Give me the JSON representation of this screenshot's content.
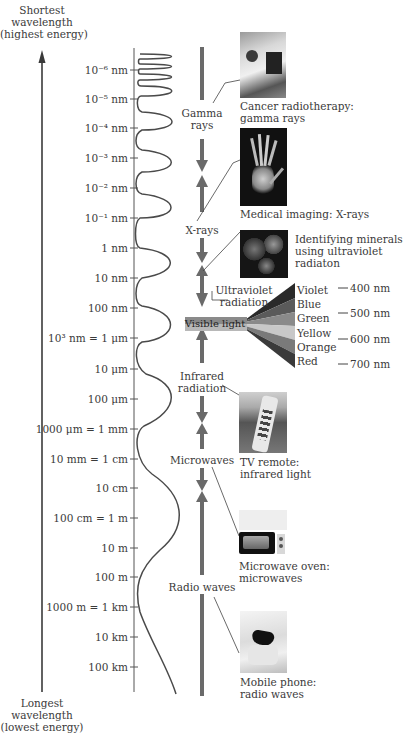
{
  "diagram": {
    "title_top": [
      "Shortest",
      "wavelength",
      "(highest energy)"
    ],
    "title_bottom": [
      "Longest",
      "wavelength",
      "(lowest energy)"
    ],
    "scale_ticks": [
      {
        "label": "10⁻⁶ nm",
        "y": 70
      },
      {
        "label": "10⁻⁵ nm",
        "y": 99
      },
      {
        "label": "10⁻⁴ nm",
        "y": 128
      },
      {
        "label": "10⁻³ nm",
        "y": 158
      },
      {
        "label": "10⁻² nm",
        "y": 188
      },
      {
        "label": "10⁻¹ nm",
        "y": 218
      },
      {
        "label": "1 nm",
        "y": 248
      },
      {
        "label": "10 nm",
        "y": 278
      },
      {
        "label": "100 nm",
        "y": 308
      },
      {
        "label": "10³ nm = 1 μm",
        "y": 338
      },
      {
        "label": "10 μm",
        "y": 369
      },
      {
        "label": "100 μm",
        "y": 399
      },
      {
        "label": "1000 μm = 1 mm",
        "y": 429
      },
      {
        "label": "10 mm = 1 cm",
        "y": 459
      },
      {
        "label": "10 cm",
        "y": 488
      },
      {
        "label": "100 cm = 1 m",
        "y": 518
      },
      {
        "label": "10 m",
        "y": 548
      },
      {
        "label": "100 m",
        "y": 577
      },
      {
        "label": "1000 m = 1 km",
        "y": 607
      },
      {
        "label": "10 km",
        "y": 637
      },
      {
        "label": "100 km",
        "y": 667
      }
    ],
    "bands": {
      "gamma": [
        "Gamma",
        "rays"
      ],
      "xrays": "X-rays",
      "ultraviolet": [
        "Ultraviolet",
        "radiation"
      ],
      "visible": "Visible light",
      "infrared": [
        "Infrared",
        "radiation"
      ],
      "microwaves": "Microwaves",
      "radio": "Radio waves"
    },
    "visible_colors": [
      "Violet",
      "Blue",
      "Green",
      "Yellow",
      "Orange",
      "Red"
    ],
    "visible_wavelengths": [
      "400 nm",
      "500 nm",
      "600 nm",
      "700 nm"
    ],
    "examples": [
      {
        "icon": "radiotherapy-photo",
        "caption": [
          "Cancer radiotherapy:",
          "gamma rays"
        ]
      },
      {
        "icon": "xray-hand-photo",
        "caption": [
          "Medical imaging: X-rays"
        ]
      },
      {
        "icon": "minerals-photo",
        "caption": [
          "Identifying minerals",
          "using ultraviolet",
          "radiaton"
        ]
      },
      {
        "icon": "tv-remote-photo",
        "caption": [
          "TV remote:",
          "infrared light"
        ]
      },
      {
        "icon": "microwave-oven-photo",
        "caption": [
          "Microwave oven:",
          "microwaves"
        ]
      },
      {
        "icon": "mobile-phone-photo",
        "caption": [
          "Mobile phone:",
          "radio waves"
        ]
      }
    ],
    "colors": {
      "ink": "#3a3a3a",
      "arrow": "#6a6a6a",
      "spectrum": [
        "#2a2a2a",
        "#5a5a5a",
        "#8a8a8a",
        "#c8c8c8",
        "#7a7a7a",
        "#3a3a3a"
      ]
    }
  }
}
